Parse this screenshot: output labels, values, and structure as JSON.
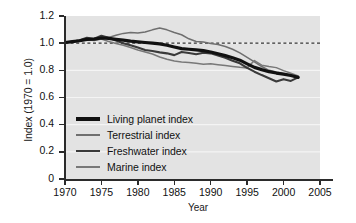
{
  "chart_data": {
    "type": "line",
    "title": "",
    "xlabel": "Year",
    "ylabel": "Index (1970 = 1.0)",
    "xlim": [
      1970,
      2005
    ],
    "ylim": [
      0,
      1.2
    ],
    "xticks": [
      "1970",
      "1975",
      "1980",
      "1985",
      "1990",
      "1995",
      "2000",
      "2005"
    ],
    "yticks": [
      "0",
      "0.2",
      "0.4",
      "0.6",
      "0.8",
      "1.0",
      "1.2"
    ],
    "grid": "horizontal-white-gridlines",
    "legend_position": "inside-lower-left",
    "plot_background": "#e3e3e3",
    "reference_line": {
      "label": "",
      "y": 1.0,
      "style": "dashed",
      "color": "#333333"
    },
    "x": [
      1970,
      1971,
      1972,
      1973,
      1974,
      1975,
      1976,
      1977,
      1978,
      1979,
      1980,
      1981,
      1982,
      1983,
      1984,
      1985,
      1986,
      1987,
      1988,
      1989,
      1990,
      1991,
      1992,
      1993,
      1994,
      1995,
      1996,
      1997,
      1998,
      1999,
      2000,
      2001,
      2002
    ],
    "series": [
      {
        "name": "Living planet index",
        "color": "#111111",
        "width": 3.2,
        "values": [
          1.005,
          1.012,
          1.018,
          1.028,
          1.03,
          1.038,
          1.035,
          1.028,
          1.022,
          1.015,
          1.01,
          1.005,
          1.0,
          0.995,
          0.985,
          0.972,
          0.96,
          0.955,
          0.95,
          0.945,
          0.935,
          0.922,
          0.908,
          0.893,
          0.875,
          0.848,
          0.822,
          0.805,
          0.79,
          0.78,
          0.772,
          0.762,
          0.748
        ]
      },
      {
        "name": "Terrestrial index",
        "color": "#6f6f6f",
        "width": 1.5,
        "values": [
          1.005,
          1.015,
          1.022,
          1.035,
          1.028,
          1.048,
          1.042,
          1.058,
          1.072,
          1.078,
          1.075,
          1.082,
          1.098,
          1.112,
          1.098,
          1.078,
          1.062,
          1.032,
          1.012,
          1.008,
          0.998,
          0.99,
          0.975,
          0.955,
          0.928,
          0.895,
          0.862,
          0.828,
          0.8,
          0.788,
          0.775,
          0.768,
          0.752
        ]
      },
      {
        "name": "Freshwater index",
        "color": "#3a3a3a",
        "width": 2.1,
        "values": [
          1.005,
          1.01,
          1.022,
          1.04,
          1.032,
          1.055,
          1.04,
          1.02,
          1.0,
          0.985,
          0.968,
          0.95,
          0.942,
          0.932,
          0.925,
          0.912,
          0.935,
          0.928,
          0.918,
          0.93,
          0.925,
          0.91,
          0.892,
          0.87,
          0.852,
          0.818,
          0.79,
          0.765,
          0.742,
          0.718,
          0.735,
          0.722,
          0.748
        ]
      },
      {
        "name": "Marine index",
        "color": "#787878",
        "width": 1.5,
        "values": [
          1.0,
          1.008,
          1.018,
          1.025,
          1.02,
          1.03,
          1.012,
          0.998,
          0.985,
          0.968,
          0.95,
          0.935,
          0.92,
          0.898,
          0.882,
          0.868,
          0.862,
          0.858,
          0.852,
          0.845,
          0.848,
          0.842,
          0.835,
          0.828,
          0.822,
          0.818,
          0.872,
          0.838,
          0.828,
          0.82,
          0.798,
          0.778,
          0.758
        ]
      }
    ]
  },
  "axis": {
    "ylabel": "Index (1970 = 1.0)",
    "xlabel": "Year",
    "yticks": [
      "1.2",
      "1.0",
      "0.8",
      "0.6",
      "0.4",
      "0.2",
      "0"
    ],
    "xticks": [
      "1970",
      "1975",
      "1980",
      "1985",
      "1990",
      "1995",
      "2000",
      "2005"
    ]
  },
  "legend": {
    "items": [
      {
        "label": "Living planet index"
      },
      {
        "label": "Terrestrial index"
      },
      {
        "label": "Freshwater index"
      },
      {
        "label": "Marine index"
      }
    ]
  }
}
